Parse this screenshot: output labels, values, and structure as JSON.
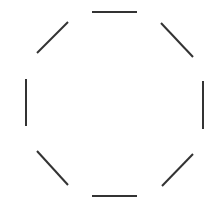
{
  "diagram": {
    "shape": "octagon",
    "style": "dashed-octagon-edges-with-gaps",
    "stroke_color": "#333333",
    "stroke_width": 2,
    "background": "#ffffff",
    "segments": [
      {
        "name": "top-edge",
        "x1": 92,
        "y1": 12,
        "x2": 137,
        "y2": 12
      },
      {
        "name": "upper-right-edge",
        "x1": 161,
        "y1": 23,
        "x2": 193,
        "y2": 57
      },
      {
        "name": "right-edge",
        "x1": 203,
        "y1": 81,
        "x2": 203,
        "y2": 129
      },
      {
        "name": "lower-right-edge",
        "x1": 193,
        "y1": 154,
        "x2": 162,
        "y2": 186
      },
      {
        "name": "bottom-edge",
        "x1": 92,
        "y1": 196,
        "x2": 137,
        "y2": 196
      },
      {
        "name": "lower-left-edge",
        "x1": 37,
        "y1": 151,
        "x2": 68,
        "y2": 185
      },
      {
        "name": "left-edge",
        "x1": 26,
        "y1": 79,
        "x2": 26,
        "y2": 126
      },
      {
        "name": "upper-left-edge",
        "x1": 37,
        "y1": 53,
        "x2": 68,
        "y2": 22
      }
    ]
  }
}
